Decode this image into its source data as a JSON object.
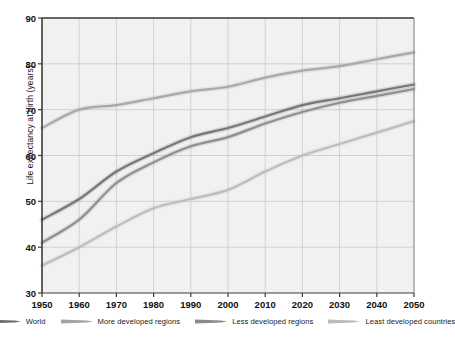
{
  "chart_data": {
    "type": "line",
    "title": "",
    "xlabel": "",
    "ylabel": "Life expectancy at birth (years)",
    "xlim": [
      1950,
      2050
    ],
    "ylim": [
      30,
      90
    ],
    "grid": true,
    "legend_position": "bottom",
    "x": [
      1950,
      1960,
      1970,
      1980,
      1990,
      2000,
      2010,
      2020,
      2030,
      2040,
      2050
    ],
    "xticks": [
      "1950",
      "1960",
      "1970",
      "1980",
      "1990",
      "2000",
      "2010",
      "2020",
      "2030",
      "2040",
      "2050"
    ],
    "yticks": [
      "30",
      "40",
      "50",
      "60",
      "70",
      "80",
      "90"
    ],
    "series": [
      {
        "name": "World",
        "color": "#777777",
        "values": [
          46.0,
          50.5,
          56.5,
          60.5,
          64.0,
          66.0,
          68.5,
          71.0,
          72.5,
          74.0,
          75.5
        ]
      },
      {
        "name": "More developed regions",
        "color": "#a9a9a9",
        "values": [
          66.0,
          70.0,
          71.0,
          72.5,
          74.0,
          75.0,
          77.0,
          78.5,
          79.5,
          81.0,
          82.5
        ]
      },
      {
        "name": "Less developed regions",
        "color": "#8f8f8f",
        "values": [
          41.0,
          46.0,
          54.0,
          58.5,
          62.0,
          64.0,
          67.0,
          69.5,
          71.5,
          73.0,
          74.5
        ]
      },
      {
        "name": "Least developed countries",
        "color": "#bdbdbd",
        "values": [
          36.0,
          40.0,
          44.5,
          48.5,
          50.5,
          52.5,
          56.5,
          60.0,
          62.5,
          65.0,
          67.5
        ]
      }
    ]
  },
  "legend": {
    "items": [
      {
        "label": "World",
        "color": "#6e6e6e"
      },
      {
        "label": "More developed regions",
        "color": "#a3a3a3"
      },
      {
        "label": "Less developed regions",
        "color": "#8a8a8a"
      },
      {
        "label": "Least developed countries",
        "color": "#bcbcbc"
      }
    ]
  },
  "style": {
    "plot_background": "#f1f1f1",
    "grid_color": "#c9c9c9",
    "axis_color": "#3c3c3c",
    "text_color": "#111111"
  }
}
